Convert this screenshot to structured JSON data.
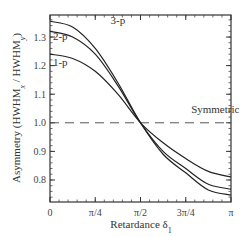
{
  "chart_data": {
    "type": "line",
    "title": "",
    "xlabel": "Retardance  δ1",
    "xlabel_main": "Retardance",
    "xlabel_symbol": "δ",
    "xlabel_sub": "1",
    "ylabel": "Asymmetry (HWHMx / HWHMy)",
    "ylabel_parts": {
      "prefix": "Asymmetry (HWHM",
      "sub1": "x",
      "mid": " / HWHM",
      "sub2": "y",
      "suffix": ")"
    },
    "xlim": [
      0,
      3.14159
    ],
    "ylim": [
      0.723,
      1.377
    ],
    "grid": false,
    "x_ticks": [
      {
        "value": 0,
        "label": "0"
      },
      {
        "value": 0.7854,
        "label": "π/4"
      },
      {
        "value": 1.5708,
        "label": "π/2"
      },
      {
        "value": 2.3562,
        "label": "3π/4"
      },
      {
        "value": 3.14159,
        "label": "π"
      }
    ],
    "y_ticks": [
      {
        "value": 0.8,
        "label": "0.8"
      },
      {
        "value": 0.9,
        "label": "0.9"
      },
      {
        "value": 1.0,
        "label": "1.0"
      },
      {
        "value": 1.1,
        "label": "1.1"
      },
      {
        "value": 1.2,
        "label": "1.2"
      },
      {
        "value": 1.3,
        "label": "1.3"
      }
    ],
    "x": [
      0,
      0.3927,
      0.7854,
      1.1781,
      1.5708,
      1.9635,
      2.3562,
      2.7489,
      3.14159
    ],
    "series": [
      {
        "name": "1-p",
        "values": [
          1.24,
          1.225,
          1.18,
          1.1,
          1.0,
          0.93,
          0.875,
          0.83,
          0.81
        ]
      },
      {
        "name": "2-p",
        "values": [
          1.32,
          1.3,
          1.24,
          1.13,
          1.0,
          0.9,
          0.84,
          0.785,
          0.768
        ]
      },
      {
        "name": "3-p",
        "values": [
          1.355,
          1.335,
          1.26,
          1.14,
          1.0,
          0.89,
          0.825,
          0.765,
          0.747
        ]
      }
    ],
    "reference_line": {
      "y": 1.0,
      "style": "dashed",
      "label": "Symmetric"
    },
    "annotations": [
      {
        "text": "3-p",
        "x": 1.05,
        "y": 1.345
      },
      {
        "text": "2-p",
        "x": 0.05,
        "y": 1.29
      },
      {
        "text": "1-p",
        "x": 0.05,
        "y": 1.2
      },
      {
        "text": "Symmetric",
        "x": 2.45,
        "y": 1.035
      }
    ],
    "legend": "none (inline labels)"
  },
  "labels": {
    "curve_3p": "3-p",
    "curve_2p": "2-p",
    "curve_1p": "1-p",
    "symmetric": "Symmetric"
  }
}
